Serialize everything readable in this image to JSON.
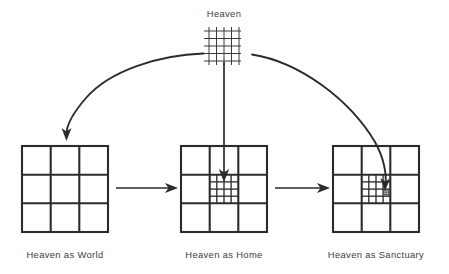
{
  "diagram": {
    "title_label": "Heaven",
    "panels": [
      {
        "id": "world",
        "caption": "Heaven as World",
        "nesting_depth": 1
      },
      {
        "id": "home",
        "caption": "Heaven as Home",
        "nesting_depth": 2
      },
      {
        "id": "sanctuary",
        "caption": "Heaven as Sanctuary",
        "nesting_depth": 3
      }
    ],
    "source_grid": {
      "name": "heaven-grid",
      "rows": 4,
      "cols": 4
    },
    "arrows": [
      {
        "name": "arrow-heaven-to-world",
        "style": "curved",
        "direction": "down-left"
      },
      {
        "name": "arrow-heaven-to-home",
        "style": "straight-vertical",
        "direction": "down"
      },
      {
        "name": "arrow-heaven-to-sanctuary",
        "style": "curved",
        "direction": "down-right"
      },
      {
        "name": "arrow-world-to-home",
        "style": "straight-horizontal",
        "direction": "right"
      },
      {
        "name": "arrow-home-to-sanctuary",
        "style": "straight-horizontal",
        "direction": "right"
      }
    ],
    "colors": {
      "line": "#2b2b2b",
      "text": "#3d3d3d",
      "background": "#ffffff"
    }
  }
}
